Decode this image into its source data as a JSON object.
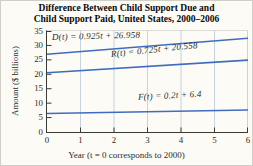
{
  "figure": {
    "title_line1": "Difference Between Child Support Due and",
    "title_line2": "Child Support Paid, United States, 2000–2006"
  },
  "chart_data": {
    "type": "line",
    "title": "Difference Between Child Support Due and Child Support Paid, United States, 2000–2006",
    "xlabel": "Year (t = 0 corresponds to 2000)",
    "ylabel": "Amount ($ billions)",
    "xlim": [
      0,
      6
    ],
    "ylim": [
      0,
      35
    ],
    "xticks": [
      0,
      1,
      2,
      3,
      4,
      5,
      6
    ],
    "yticks": [
      0,
      5,
      10,
      15,
      20,
      25,
      30,
      35
    ],
    "grid": "vertical",
    "legend_position": "inline-labels",
    "line_color": "#3f6cc0",
    "gridline_color": "#c4d2e2",
    "axis_color": "#3a3a35",
    "series": [
      {
        "name": "D",
        "label": "D(t) = 0.925t + 26.958",
        "slope": 0.925,
        "intercept": 26.958,
        "x": [
          0,
          6
        ],
        "values": [
          26.958,
          32.508
        ]
      },
      {
        "name": "R",
        "label": "R(t) = 0.725t + 20.558",
        "slope": 0.725,
        "intercept": 20.558,
        "x": [
          0,
          6
        ],
        "values": [
          20.558,
          24.908
        ]
      },
      {
        "name": "F",
        "label": "F(t) = 0.2t + 6.4",
        "slope": 0.2,
        "intercept": 6.4,
        "x": [
          0,
          6
        ],
        "values": [
          6.4,
          7.6
        ]
      }
    ]
  }
}
